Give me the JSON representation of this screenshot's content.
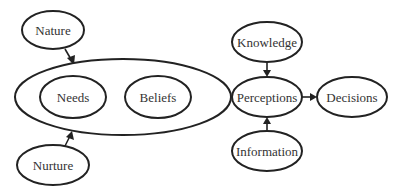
{
  "diagram": {
    "type": "flow-concept-diagram",
    "nodes": {
      "nature": {
        "label": "Nature"
      },
      "nurture": {
        "label": "Nurture"
      },
      "group": {
        "label": ""
      },
      "needs": {
        "label": "Needs"
      },
      "beliefs": {
        "label": "Beliefs"
      },
      "knowledge": {
        "label": "Knowledge"
      },
      "perceptions": {
        "label": "Perceptions"
      },
      "information": {
        "label": "Information"
      },
      "decisions": {
        "label": "Decisions"
      }
    },
    "edges": [
      {
        "from": "Nature",
        "to": "Needs+Beliefs group"
      },
      {
        "from": "Nurture",
        "to": "Needs+Beliefs group"
      },
      {
        "from": "Needs+Beliefs group",
        "to": "Perceptions"
      },
      {
        "from": "Knowledge",
        "to": "Perceptions"
      },
      {
        "from": "Information",
        "to": "Perceptions"
      },
      {
        "from": "Perceptions",
        "to": "Decisions"
      }
    ],
    "colors": {
      "stroke": "#222222",
      "text": "#333333",
      "background": "#ffffff"
    }
  }
}
